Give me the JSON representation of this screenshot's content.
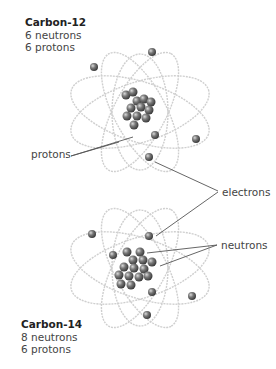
{
  "atoms": [
    {
      "title": "Carbon-12",
      "neutrons_text": "6 neutrons",
      "protons_text": "6 protons",
      "neutrons": 6,
      "protons": 6
    },
    {
      "title": "Carbon-14",
      "neutrons_text": "8 neutrons",
      "protons_text": "6 protons",
      "neutrons": 8,
      "protons": 6
    }
  ],
  "callouts": {
    "protons": "protons",
    "electrons": "electrons",
    "neutrons": "neutrons"
  },
  "colors": {
    "orbit": "#c8c8c8",
    "particle": "#6e6e6e",
    "particle_highlight": "#bdbdbd",
    "leader_line": "#555555",
    "text": "#444444"
  }
}
